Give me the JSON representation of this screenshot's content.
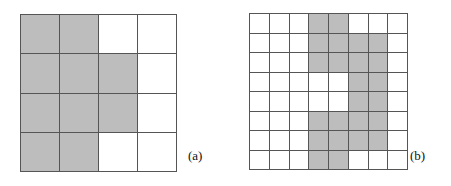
{
  "figure_colors": {
    "filled": "#bdbdbd",
    "empty": "#ffffff",
    "gridline": "#555555",
    "background": "#ffffff",
    "text": "#111111"
  },
  "figures": [
    {
      "id": "figure-a",
      "label": "(a)",
      "rows": 4,
      "cols": 4,
      "cell_states": [
        [
          1,
          1,
          0,
          0
        ],
        [
          1,
          1,
          1,
          0
        ],
        [
          1,
          1,
          1,
          0
        ],
        [
          1,
          1,
          0,
          0
        ]
      ],
      "filled_count": 10,
      "total_count": 16
    },
    {
      "id": "figure-b",
      "label": "(b)",
      "rows": 8,
      "cols": 8,
      "cell_states": [
        [
          0,
          0,
          0,
          1,
          1,
          0,
          0,
          0
        ],
        [
          0,
          0,
          0,
          1,
          1,
          1,
          1,
          0
        ],
        [
          0,
          0,
          0,
          1,
          1,
          1,
          1,
          0
        ],
        [
          0,
          0,
          0,
          0,
          0,
          1,
          1,
          0
        ],
        [
          0,
          0,
          0,
          0,
          0,
          1,
          1,
          0
        ],
        [
          0,
          0,
          0,
          1,
          1,
          1,
          1,
          0
        ],
        [
          0,
          0,
          0,
          1,
          1,
          1,
          1,
          0
        ],
        [
          0,
          0,
          0,
          1,
          1,
          0,
          0,
          0
        ]
      ],
      "filled_count": 26,
      "total_count": 64
    }
  ]
}
